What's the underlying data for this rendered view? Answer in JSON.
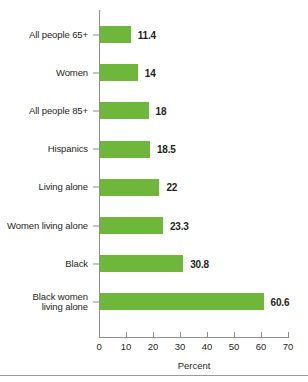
{
  "chart_data": {
    "type": "bar",
    "orientation": "horizontal",
    "title": "",
    "xlabel": "Percent",
    "ylabel": "",
    "xlim": [
      0,
      70
    ],
    "xticks": [
      0,
      10,
      20,
      30,
      40,
      50,
      60,
      70
    ],
    "grid": false,
    "legend": null,
    "bar_color": "#6FB73A",
    "axis_color": "#8D8D8D",
    "text_color": "#231F20",
    "categories": [
      "All people 65+",
      "Women",
      "All people 85+",
      "Hispanics",
      "Living alone",
      "Women living alone",
      "Black",
      "Black women\nliving alone"
    ],
    "values": [
      11.4,
      14,
      18,
      18.5,
      22,
      23.3,
      30.8,
      60.6
    ],
    "value_labels": [
      "11.4",
      "14",
      "18",
      "18.5",
      "22",
      "23.3",
      "30.8",
      "60.6"
    ]
  }
}
